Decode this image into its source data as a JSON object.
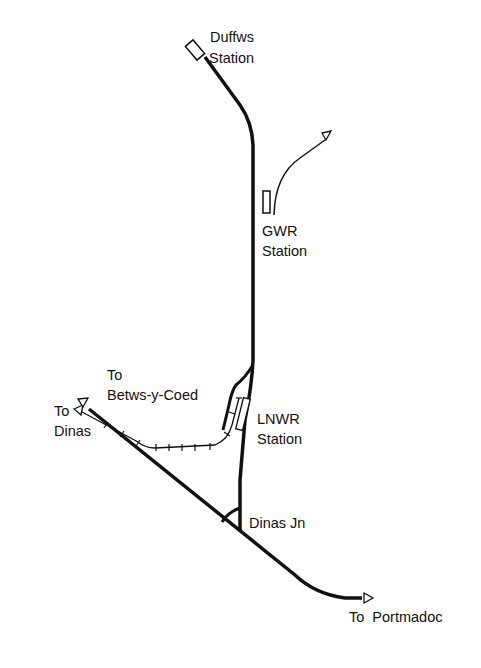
{
  "diagram": {
    "type": "railway-track-plan",
    "colors": {
      "track": "#111111",
      "background": "#ffffff"
    },
    "labels": {
      "duffws": [
        "Duffws",
        "Station"
      ],
      "gwr": [
        "GWR",
        "Station"
      ],
      "lnwr": [
        "LNWR",
        "Station"
      ],
      "betws": [
        "To",
        "Betws-y-Coed"
      ],
      "dinas": [
        "To",
        "Dinas"
      ],
      "dinas_jn": "Dinas Jn",
      "portmadoc": "To  Portmadoc"
    },
    "stations": [
      "Duffws Station",
      "GWR Station",
      "LNWR Station"
    ],
    "junctions": [
      "Dinas Jn"
    ],
    "destinations": [
      "To Dinas",
      "To Betws-y-Coed",
      "To Portmadoc"
    ]
  }
}
